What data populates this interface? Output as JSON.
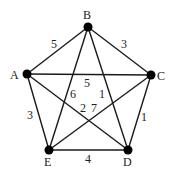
{
  "graph": {
    "nodes": [
      {
        "id": "A",
        "x": 27,
        "y": 74,
        "lx": 10,
        "ly": 79
      },
      {
        "id": "B",
        "x": 88,
        "y": 27,
        "lx": 83,
        "ly": 19
      },
      {
        "id": "C",
        "x": 151,
        "y": 75,
        "lx": 157,
        "ly": 80
      },
      {
        "id": "D",
        "x": 128,
        "y": 150,
        "lx": 123,
        "ly": 166
      },
      {
        "id": "E",
        "x": 49,
        "y": 150,
        "lx": 44,
        "ly": 166
      }
    ],
    "edges": [
      {
        "from": "A",
        "to": "B",
        "weight": "5",
        "lx": 51,
        "ly": 48
      },
      {
        "from": "B",
        "to": "C",
        "weight": "3",
        "lx": 121,
        "ly": 48
      },
      {
        "from": "A",
        "to": "C",
        "weight": "5",
        "lx": 84,
        "ly": 87
      },
      {
        "from": "B",
        "to": "E",
        "weight": "6",
        "lx": 70,
        "ly": 98
      },
      {
        "from": "B",
        "to": "D",
        "weight": "1",
        "lx": 99,
        "ly": 98
      },
      {
        "from": "A",
        "to": "D",
        "weight": "2",
        "lx": 80,
        "ly": 112
      },
      {
        "from": "C",
        "to": "E",
        "weight": "7",
        "lx": 91,
        "ly": 112
      },
      {
        "from": "A",
        "to": "E",
        "weight": "3",
        "lx": 27,
        "ly": 119
      },
      {
        "from": "C",
        "to": "D",
        "weight": "1",
        "lx": 141,
        "ly": 121
      },
      {
        "from": "E",
        "to": "D",
        "weight": "4",
        "lx": 85,
        "ly": 163
      }
    ]
  }
}
